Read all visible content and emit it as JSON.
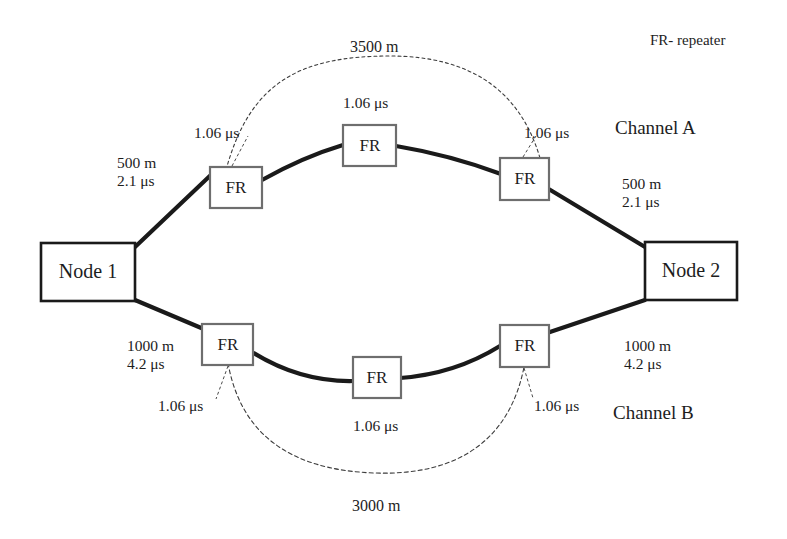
{
  "figure": {
    "type": "network-diagram",
    "title": "",
    "legend": "FR- repeater",
    "background_color": "#ffffff",
    "line_color": "#1a1a1a",
    "box_border_color": "#6e6e6e",
    "node_border_color": "#1a1a1a"
  },
  "nodes": {
    "left": "Node 1",
    "right": "Node 2"
  },
  "repeaters": {
    "label": "FR",
    "channel_a": [
      "FR",
      "FR",
      "FR"
    ],
    "channel_b": [
      "FR",
      "FR",
      "FR"
    ]
  },
  "channels": {
    "a": {
      "name": "Channel A",
      "span_label": "3500 m",
      "left_segment": {
        "distance": "500 m",
        "delay": "2.1 μs"
      },
      "right_segment": {
        "distance": "500 m",
        "delay": "2.1 μs"
      },
      "repeater_delays": [
        "1.06 μs",
        "1.06 μs",
        "1.06 μs"
      ]
    },
    "b": {
      "name": "Channel B",
      "span_label": "3000 m",
      "left_segment": {
        "distance": "1000 m",
        "delay": "4.2 μs"
      },
      "right_segment": {
        "distance": "1000 m",
        "delay": "4.2 μs"
      },
      "repeater_delays": [
        "1.06 μs",
        "1.06 μs",
        "1.06 μs"
      ]
    }
  },
  "annotations": {
    "a_left_distance": "500 m",
    "a_left_delay": "2.1 μs",
    "a_right_distance": "500 m",
    "a_right_delay": "2.1 μs",
    "b_left_distance": "1000 m",
    "b_left_delay": "4.2 μs",
    "b_right_distance": "1000 m",
    "b_right_delay": "4.2 μs",
    "a_span": "3500 m",
    "b_span": "3000 m",
    "a_rep_left": "1.06 μs",
    "a_rep_center": "1.06 μs",
    "a_rep_right": "1.06 μs",
    "b_rep_left": "1.06 μs",
    "b_rep_center": "1.06 μs",
    "b_rep_right": "1.06 μs",
    "channel_a": "Channel A",
    "channel_b": "Channel B",
    "legend": "FR- repeater"
  }
}
